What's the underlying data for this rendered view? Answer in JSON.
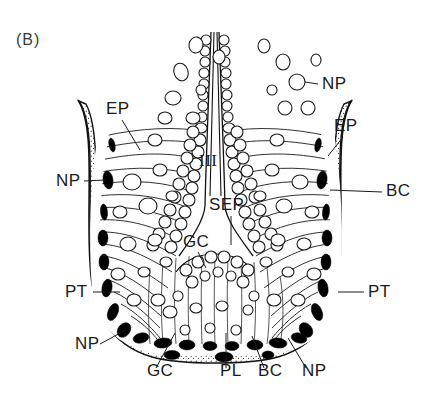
{
  "figure": {
    "panel_label": "(B)",
    "type": "anatomical-histology-cross-section",
    "background_color": "#ffffff",
    "ink_color": "#111111"
  },
  "labels": [
    {
      "id": "ep-left",
      "text": "EP",
      "x": 106,
      "y": 114
    },
    {
      "id": "ep-right",
      "text": "EP",
      "x": 334,
      "y": 131
    },
    {
      "id": "np-upper-right",
      "text": "NP",
      "x": 322,
      "y": 89
    },
    {
      "id": "np-left",
      "text": "NP",
      "x": 56,
      "y": 186
    },
    {
      "id": "bc-right",
      "text": "BC",
      "x": 386,
      "y": 196
    },
    {
      "id": "iii-center",
      "text": "III",
      "x": 199,
      "y": 166
    },
    {
      "id": "sep-center",
      "text": "SEP",
      "x": 209,
      "y": 210
    },
    {
      "id": "gc-inner",
      "text": "GC",
      "x": 183,
      "y": 247
    },
    {
      "id": "pt-left",
      "text": "PT",
      "x": 65,
      "y": 297
    },
    {
      "id": "pt-right",
      "text": "PT",
      "x": 368,
      "y": 297
    },
    {
      "id": "np-lower-left",
      "text": "NP",
      "x": 75,
      "y": 349
    },
    {
      "id": "gc-bottom",
      "text": "GC",
      "x": 147,
      "y": 376
    },
    {
      "id": "pl-bottom",
      "text": "PL",
      "x": 220,
      "y": 376
    },
    {
      "id": "bc-bottom",
      "text": "BC",
      "x": 258,
      "y": 376
    },
    {
      "id": "np-bottom",
      "text": "NP",
      "x": 302,
      "y": 376
    }
  ],
  "abbreviations": {
    "EP": "epithelium",
    "NP": "nucleus / nuclear profile",
    "BC": "basal cell",
    "PT": "perithelium",
    "SEP": "septum",
    "GC": "gland cell",
    "PL": "plasma layer",
    "III": "cavity / lumen III"
  },
  "leaders": [
    {
      "id": "leader-ep-left",
      "d": "M122,120 L140,150"
    },
    {
      "id": "leader-ep-right",
      "d": "M343,137 L328,156"
    },
    {
      "id": "leader-np-upper-right",
      "d": "M318,84 L296,80"
    },
    {
      "id": "leader-np-left",
      "d": "M84,181 L107,180"
    },
    {
      "id": "leader-bc-right",
      "d": "M382,192 L360,194"
    },
    {
      "id": "leader-sep-center",
      "d": "M231,216 L231,238"
    },
    {
      "id": "leader-gc-inner",
      "d": "M198,252 L206,268"
    },
    {
      "id": "leader-pt-left",
      "d": "M93,292 L118,292"
    },
    {
      "id": "leader-pt-right",
      "d": "M364,292 L340,292"
    },
    {
      "id": "leader-np-lower-left",
      "d": "M100,344 L124,330"
    },
    {
      "id": "leader-gc-bottom",
      "d": "M156,368 L172,333"
    },
    {
      "id": "leader-pl-bottom",
      "d": "M226,368 L226,331"
    },
    {
      "id": "leader-bc-bottom",
      "d": "M264,368 L254,335"
    },
    {
      "id": "leader-np-bottom",
      "d": "M306,368 L288,338"
    }
  ],
  "free_cells": [
    {
      "cx": 181,
      "cy": 72,
      "rx": 7,
      "ry": 9,
      "rot": -20
    },
    {
      "cx": 196,
      "cy": 45,
      "rx": 7,
      "ry": 8,
      "rot": 10
    },
    {
      "cx": 173,
      "cy": 98,
      "rx": 8,
      "ry": 7,
      "rot": 0
    },
    {
      "cx": 201,
      "cy": 90,
      "rx": 5,
      "ry": 5,
      "rot": 0
    },
    {
      "cx": 219,
      "cy": 57,
      "rx": 6,
      "ry": 7,
      "rot": 0
    },
    {
      "cx": 165,
      "cy": 118,
      "rx": 7,
      "ry": 6,
      "rot": 0
    },
    {
      "cx": 193,
      "cy": 118,
      "rx": 7,
      "ry": 6,
      "rot": 0
    },
    {
      "cx": 283,
      "cy": 62,
      "rx": 7,
      "ry": 8,
      "rot": 0
    },
    {
      "cx": 297,
      "cy": 82,
      "rx": 8,
      "ry": 8,
      "rot": 0
    },
    {
      "cx": 272,
      "cy": 90,
      "rx": 5,
      "ry": 5,
      "rot": 0
    },
    {
      "cx": 285,
      "cy": 108,
      "rx": 7,
      "ry": 7,
      "rot": 0
    },
    {
      "cx": 308,
      "cy": 108,
      "rx": 7,
      "ry": 7,
      "rot": 0
    },
    {
      "cx": 264,
      "cy": 46,
      "rx": 6,
      "ry": 7,
      "rot": 0
    },
    {
      "cx": 316,
      "cy": 60,
      "rx": 5,
      "ry": 6,
      "rot": 0
    }
  ]
}
